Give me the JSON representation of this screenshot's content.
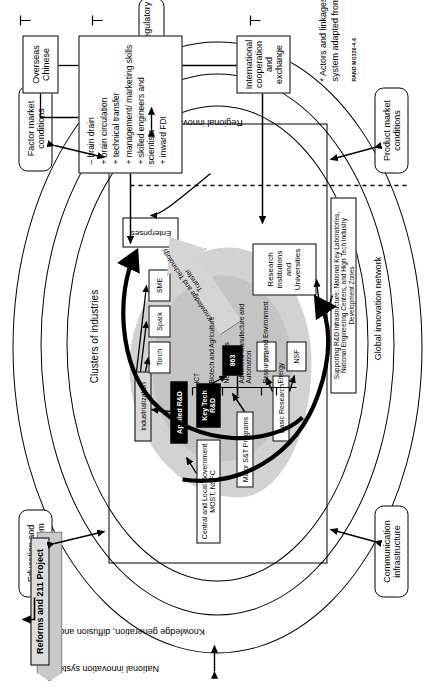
{
  "figure": {
    "caption_note": "* Actors and linkages in the innovation system adapted from OECD (1999).",
    "rand_code": "RAND MG320-4.6"
  },
  "rings": {
    "outer_label": "National innovation system*",
    "middle_label": "Knowledge generation, diffusion and use",
    "regional_label": "Regional innovation systems",
    "global_label": "Global innovation network",
    "clusters_label": "Clusters of industries"
  },
  "context_boxes": [
    {
      "id": "education",
      "label": "Education and training system"
    },
    {
      "id": "factor-market",
      "label": "Factor market conditions"
    },
    {
      "id": "macro",
      "label": "Macroeconomic and regulatory context"
    },
    {
      "id": "product-market",
      "label": "Product market conditions"
    },
    {
      "id": "communication",
      "label": "Communication infrastructure"
    }
  ],
  "banner": {
    "label": "Reforms and 211 Project"
  },
  "core": {
    "government": "Central and Local Government MOST, NSFC",
    "major_programs": "Major S&T Programs",
    "industrialization": "Industrialization",
    "applied_rd": "Applied R&D",
    "key_tech_rd": "Key Tech R&D",
    "basic_research": "Basic Research",
    "programs": [
      {
        "id": "863",
        "label": "863"
      },
      {
        "id": "973",
        "label": "973"
      },
      {
        "id": "nsf",
        "label": "NSF"
      },
      {
        "id": "torch",
        "label": "Torch"
      },
      {
        "id": "spark",
        "label": "Spark"
      },
      {
        "id": "sme",
        "label": "SME"
      }
    ],
    "enterprises": "Enterprises",
    "research_institutions": "Research institutions and Universities",
    "transfer_arrow": "Knowledge and Technology Transfer",
    "infrastructure": "Supporting R&D Infrastructure: National Key Laboratories, National Engineering Centers, and High Tech Industry Development Zones",
    "priority_fields": [
      "ICT",
      "Biotech and Agriculture",
      "New materials",
      "Advanced Manufacture and Automation",
      "Resources and Environment",
      "Energy"
    ]
  },
  "external": {
    "overseas_chinese": "Overseas Chinese",
    "international_coop": "International cooperation and exchange",
    "effects": [
      "– brain drain",
      "+ brain circulation",
      "+ technical transfer",
      "+ management/ marketing skills",
      "+ skilled engineers and scientists",
      "+ inward FDI"
    ]
  }
}
